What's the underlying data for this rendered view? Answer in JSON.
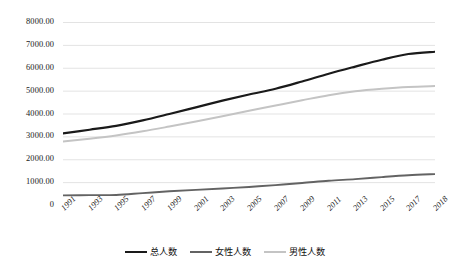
{
  "chart_data": {
    "type": "line",
    "title": "",
    "xlabel": "",
    "ylabel": "",
    "grid": true,
    "legend_position": "bottom",
    "ylim": [
      0,
      8000
    ],
    "ytick_step": 1000,
    "ytick_labels": [
      "8000.00",
      "7000.00",
      "6000.00",
      "5000.00",
      "4000.00",
      "3000.00",
      "2000.00",
      "1000.00",
      "0"
    ],
    "ytick_values": [
      8000,
      7000,
      6000,
      5000,
      4000,
      3000,
      2000,
      1000,
      0
    ],
    "categories": [
      "1991",
      "1993",
      "1995",
      "1997",
      "1999",
      "2001",
      "2003",
      "2005",
      "2007",
      "2009",
      "2011",
      "2013",
      "2015",
      "2017",
      "2018"
    ],
    "series": [
      {
        "name": "总人数",
        "color": "#1a1a1a",
        "width": 2.2,
        "values": [
          3130,
          3290,
          3460,
          3700,
          3980,
          4270,
          4560,
          4830,
          5080,
          5400,
          5740,
          6050,
          6350,
          6600,
          6700
        ]
      },
      {
        "name": "女性人数",
        "color": "#636363",
        "width": 1.9,
        "values": [
          420,
          430,
          440,
          520,
          600,
          660,
          720,
          790,
          870,
          960,
          1060,
          1130,
          1220,
          1300,
          1350
        ]
      },
      {
        "name": "男性人数",
        "color": "#c4c4c4",
        "width": 2.0,
        "values": [
          2780,
          2900,
          3040,
          3220,
          3430,
          3650,
          3880,
          4120,
          4350,
          4580,
          4800,
          4970,
          5080,
          5160,
          5200
        ]
      }
    ]
  },
  "legend": {
    "items": [
      {
        "label": "总人数",
        "color": "#1a1a1a",
        "width": "2.4px"
      },
      {
        "label": "女性人数",
        "color": "#636363",
        "width": "2.0px"
      },
      {
        "label": "男性人数",
        "color": "#c4c4c4",
        "width": "2.0px"
      }
    ]
  },
  "grid": {
    "line_color": "#e3e3e3"
  }
}
